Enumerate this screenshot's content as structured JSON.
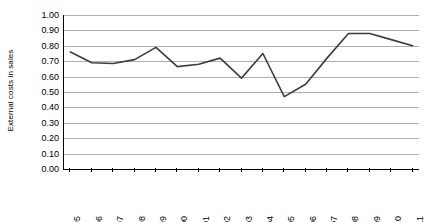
{
  "chart_data": {
    "type": "line",
    "title": "",
    "subtitle": "",
    "xlabel": "",
    "ylabel": "External costs in sales",
    "categories": [
      "1995",
      "1996",
      "1997",
      "1998",
      "1999",
      "2000",
      "2001",
      "2002",
      "2003",
      "2004",
      "2005",
      "2006",
      "2007",
      "2008",
      "2009",
      "2010",
      "2011"
    ],
    "values": [
      0.76,
      0.69,
      0.685,
      0.71,
      0.79,
      0.665,
      0.68,
      0.72,
      0.59,
      0.75,
      0.47,
      0.55,
      0.72,
      0.88,
      0.88,
      0.84,
      0.8
    ],
    "series": [
      {
        "name": "External costs in sales",
        "values": [
          0.76,
          0.69,
          0.685,
          0.71,
          0.79,
          0.665,
          0.68,
          0.72,
          0.59,
          0.75,
          0.47,
          0.55,
          0.72,
          0.88,
          0.88,
          0.84,
          0.8
        ],
        "color": "#3d3d3d"
      }
    ],
    "ylim": [
      0.0,
      1.0
    ],
    "ytick_labels": [
      "0.00",
      "0.10",
      "0.20",
      "0.30",
      "0.40",
      "0.50",
      "0.60",
      "0.70",
      "0.80",
      "0.90",
      "1.00"
    ],
    "ytick_values": [
      0.0,
      0.1,
      0.2,
      0.3,
      0.4,
      0.5,
      0.6,
      0.7,
      0.8,
      0.9,
      1.0
    ],
    "grid": true,
    "grid_color": "#b0b0b0",
    "legend": false,
    "legend_position": "none",
    "annotations": [],
    "axis_color": "#000000",
    "background": "#ffffff"
  }
}
